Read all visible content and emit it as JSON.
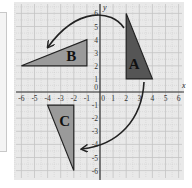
{
  "diagram": {
    "type": "coordinate-plane-rotation",
    "axes": {
      "x_label": "x",
      "y_label": "y",
      "x_ticks": [
        "-6",
        "-5",
        "-4",
        "-3",
        "-2",
        "-1",
        "0",
        "1",
        "2",
        "3",
        "4",
        "5",
        "6"
      ],
      "y_ticks": [
        "6",
        "5",
        "4",
        "3",
        "2",
        "1",
        "-1",
        "-2",
        "-3",
        "-4",
        "-5",
        "-6"
      ],
      "origin_label": "0",
      "range": {
        "xmin": -6,
        "xmax": 6,
        "ymin": -6,
        "ymax": 6
      }
    },
    "shapes": [
      {
        "label": "A",
        "vertices": [
          [
            2,
            6
          ],
          [
            2,
            1
          ],
          [
            4,
            1
          ]
        ],
        "fill": "#555555"
      },
      {
        "label": "B",
        "vertices": [
          [
            -6,
            2
          ],
          [
            -1,
            2
          ],
          [
            -1,
            4
          ]
        ],
        "fill": "#9a9a9a"
      },
      {
        "label": "C",
        "vertices": [
          [
            -4,
            -1
          ],
          [
            -2,
            -1
          ],
          [
            -2,
            -6
          ]
        ],
        "fill": "#9a9a9a"
      }
    ],
    "arrows": [
      {
        "name": "rotation-A-to-B",
        "from": "A",
        "to": "B",
        "direction": "counterclockwise"
      },
      {
        "name": "rotation-A-to-C",
        "from": "A",
        "to": "C",
        "direction": "clockwise"
      }
    ],
    "colors": {
      "grid_background": "#e9e9e9",
      "grid_line": "#c4c4c4",
      "axis": "#333333",
      "arrow": "#222222"
    }
  }
}
